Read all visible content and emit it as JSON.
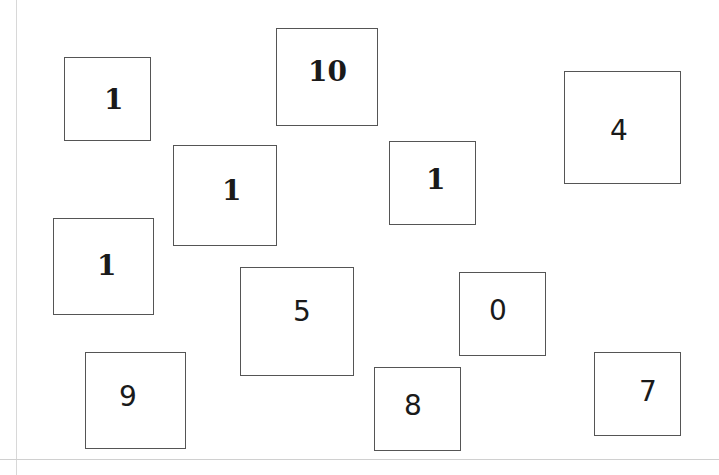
{
  "cards": [
    {
      "value": "1",
      "x": 64,
      "y": 57,
      "w": 87,
      "h": 84,
      "tx": 39,
      "ty": 28,
      "style": "serif"
    },
    {
      "value": "10",
      "x": 276,
      "y": 28,
      "w": 102,
      "h": 98,
      "tx": 31,
      "ty": 29,
      "style": "serif"
    },
    {
      "value": "4",
      "x": 564,
      "y": 71,
      "w": 117,
      "h": 113,
      "tx": 45,
      "ty": 45,
      "style": "sans"
    },
    {
      "value": "1",
      "x": 173,
      "y": 145,
      "w": 104,
      "h": 101,
      "tx": 48,
      "ty": 31,
      "style": "serif"
    },
    {
      "value": "1",
      "x": 389,
      "y": 141,
      "w": 87,
      "h": 84,
      "tx": 36,
      "ty": 24,
      "style": "serif"
    },
    {
      "value": "1",
      "x": 53,
      "y": 218,
      "w": 101,
      "h": 97,
      "tx": 43,
      "ty": 33,
      "style": "serif"
    },
    {
      "value": "5",
      "x": 240,
      "y": 267,
      "w": 114,
      "h": 109,
      "tx": 52,
      "ty": 30,
      "style": "sans"
    },
    {
      "value": "0",
      "x": 459,
      "y": 272,
      "w": 87,
      "h": 84,
      "tx": 29,
      "ty": 24,
      "style": "sans"
    },
    {
      "value": "9",
      "x": 85,
      "y": 352,
      "w": 101,
      "h": 97,
      "tx": 33,
      "ty": 30,
      "style": "sans"
    },
    {
      "value": "8",
      "x": 374,
      "y": 367,
      "w": 87,
      "h": 84,
      "tx": 29,
      "ty": 24,
      "style": "sans"
    },
    {
      "value": "7",
      "x": 594,
      "y": 352,
      "w": 87,
      "h": 84,
      "tx": 44,
      "ty": 25,
      "style": "sans"
    }
  ]
}
